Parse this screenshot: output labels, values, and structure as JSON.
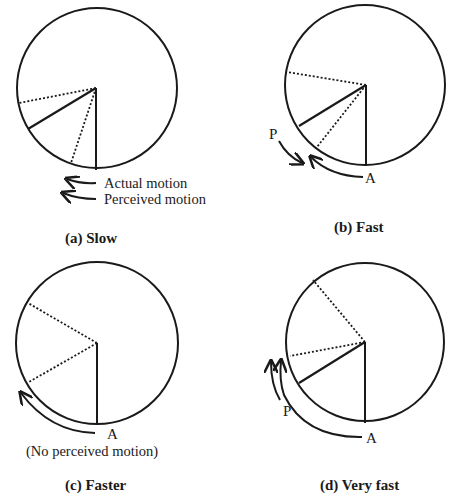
{
  "figure": {
    "panels": [
      {
        "id": "a",
        "caption": "(a) Slow",
        "legend": {
          "actual": "Actual motion",
          "perceived": "Perceived motion"
        }
      },
      {
        "id": "b",
        "caption": "(b) Fast",
        "labels": {
          "perceived": "P",
          "actual": "A"
        }
      },
      {
        "id": "c",
        "caption": "(c) Faster",
        "labels": {
          "actual": "A",
          "note": "(No perceived motion)"
        }
      },
      {
        "id": "d",
        "caption": "(d) Very fast",
        "labels": {
          "perceived": "P",
          "actual": "A"
        }
      }
    ]
  }
}
